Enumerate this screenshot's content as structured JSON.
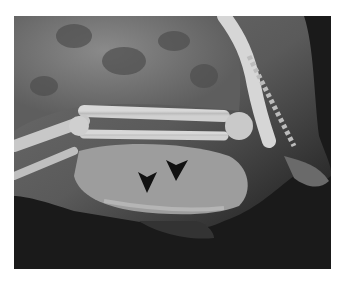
{
  "figure": {
    "type": "radiograph",
    "annotations": [
      {
        "kind": "arrowhead",
        "color": "#111111",
        "tip": [
          147,
          193
        ]
      },
      {
        "kind": "arrowhead",
        "color": "#111111",
        "tip": [
          176,
          181
        ]
      }
    ]
  }
}
